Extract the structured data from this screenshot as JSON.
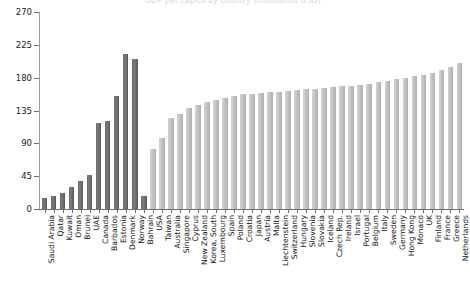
{
  "chart_data": {
    "type": "bar",
    "title": "GDP per capita by country (thousands USD)",
    "xlabel": "",
    "ylabel": "",
    "ylim": [
      0,
      270
    ],
    "yticks": [
      0,
      45,
      90,
      135,
      180,
      225,
      270
    ],
    "ytick_labels": [
      "0",
      "45",
      "90",
      "135",
      "180",
      "225",
      "270"
    ],
    "grid": false,
    "legend": "none",
    "categories": [
      "Saudi Arabia",
      "Qatar",
      "Kuwait",
      "Oman",
      "Brunei",
      "UAE",
      "Canada",
      "Barbados",
      "Estonia",
      "Denmark",
      "Norway",
      "Bahrain",
      "USA",
      "Taiwan",
      "Australia",
      "Singapore",
      "Cyprus",
      "New Zealand",
      "Korea, South",
      "Luxembourg",
      "Spain",
      "Poland",
      "Croatia",
      "Japan",
      "Austria",
      "Malta",
      "Liechtenstein",
      "Switzerland",
      "Hungary",
      "Slovenia",
      "Slovakia",
      "Iceland",
      "Czech Rep.",
      "Ireland",
      "Israel",
      "Portugal",
      "Belgium",
      "Italy",
      "Sweden",
      "Germany",
      "Hong Kong",
      "Monaco",
      "UK",
      "Finland",
      "France",
      "Greece",
      "Netherlands"
    ],
    "values": [
      15,
      18,
      22,
      30,
      38,
      46,
      118,
      120,
      155,
      213,
      205,
      18,
      82,
      98,
      125,
      130,
      138,
      143,
      146,
      150,
      152,
      155,
      157,
      158,
      159,
      160,
      161,
      162,
      163,
      164,
      165,
      166,
      167,
      168,
      169,
      170,
      172,
      174,
      176,
      178,
      180,
      182,
      184,
      186,
      190,
      194,
      200
    ],
    "series_colors": {
      "dark": "#6a6a6a",
      "light": "#c3c3c3"
    },
    "dark_group_count": 12,
    "axis_color": "#6f6f6f"
  }
}
